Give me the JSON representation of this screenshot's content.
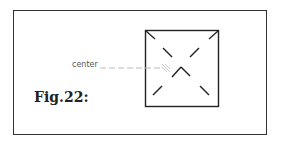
{
  "figure": {
    "caption": "Fig.22:",
    "annotation": "center",
    "colors": {
      "stroke": "#222222",
      "leader": "#bbbbbb",
      "background": "#ffffff"
    }
  }
}
